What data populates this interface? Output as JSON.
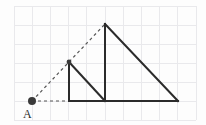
{
  "figure": {
    "canvas": {
      "width": 206,
      "height": 125,
      "background": "#fdfdfd"
    },
    "grid": {
      "visible": true,
      "color": "#e9e9ec",
      "x_start": 14,
      "x_end": 196,
      "y_start": 6,
      "y_end": 120,
      "cell_width": 18.2,
      "cell_height": 19,
      "columns": 10,
      "rows": 6
    },
    "colors": {
      "solid_stroke": "#2b2b2b",
      "dashed_stroke": "#555555",
      "point_fill": "#3a3a3a",
      "label_fill": "#2b2b2b"
    },
    "points": [
      {
        "id": "A",
        "label": "A",
        "x": 32,
        "y": 101,
        "dot": true,
        "label_x": 23,
        "label_y": 118
      },
      {
        "id": "B",
        "label": "",
        "x": 69,
        "y": 101,
        "dot": false
      },
      {
        "id": "C",
        "label": "",
        "x": 69,
        "y": 62,
        "dot": true
      },
      {
        "id": "D",
        "label": "",
        "x": 105,
        "y": 101,
        "dot": false
      },
      {
        "id": "E",
        "label": "",
        "x": 105,
        "y": 24,
        "dot": false
      },
      {
        "id": "F",
        "label": "",
        "x": 178,
        "y": 101,
        "dot": false
      }
    ],
    "solid_segments": [
      {
        "name": "small-triangle-vertical-leg",
        "x1": 69,
        "y1": 62,
        "x2": 69,
        "y2": 101
      },
      {
        "name": "small-triangle-base",
        "x1": 69,
        "y1": 101,
        "x2": 105,
        "y2": 101
      },
      {
        "name": "small-triangle-hypotenuse",
        "x1": 69,
        "y1": 62,
        "x2": 105,
        "y2": 101
      },
      {
        "name": "large-triangle-vertical-leg",
        "x1": 105,
        "y1": 24,
        "x2": 105,
        "y2": 101
      },
      {
        "name": "large-triangle-base",
        "x1": 105,
        "y1": 101,
        "x2": 178,
        "y2": 101
      },
      {
        "name": "large-triangle-hypotenuse",
        "x1": 105,
        "y1": 24,
        "x2": 178,
        "y2": 101
      }
    ],
    "dashed_segments": [
      {
        "name": "ray-A-to-large-apex",
        "x1": 32,
        "y1": 101,
        "x2": 105,
        "y2": 24
      },
      {
        "name": "ray-A-to-small-base-vertex",
        "x1": 32,
        "y1": 101,
        "x2": 69,
        "y2": 101
      }
    ],
    "labels": {
      "point_a": "A"
    }
  }
}
